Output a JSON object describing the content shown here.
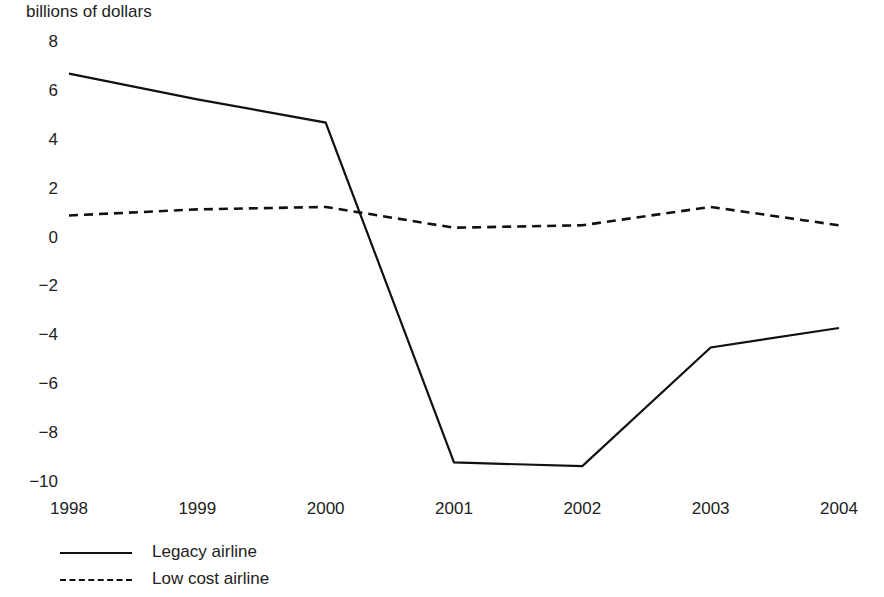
{
  "chart_data": {
    "type": "line",
    "title": "",
    "ylabel": "billions of dollars",
    "xlabel": "",
    "categories": [
      "1998",
      "1999",
      "2000",
      "2001",
      "2002",
      "2003",
      "2004"
    ],
    "x": [
      1998,
      1999,
      2000,
      2001,
      2002,
      2003,
      2004
    ],
    "ylim": [
      -10,
      8
    ],
    "xlim": [
      1998,
      2004
    ],
    "yticks": [
      8,
      6,
      4,
      2,
      0,
      -2,
      -4,
      -6,
      -8,
      -10
    ],
    "ytick_labels": [
      "8",
      "6",
      "4",
      "2",
      "0",
      "−2",
      "−4",
      "−6",
      "−8",
      "−10"
    ],
    "grid": false,
    "legend_position": "below-left",
    "series": [
      {
        "name": "Legacy airline",
        "style": "solid",
        "color": "#111111",
        "values": [
          6.7,
          5.65,
          4.7,
          -9.2,
          -9.35,
          -4.5,
          -3.7
        ]
      },
      {
        "name": "Low cost airline",
        "style": "dashed",
        "color": "#111111",
        "values": [
          0.9,
          1.15,
          1.25,
          0.4,
          0.5,
          1.25,
          0.5
        ]
      }
    ]
  },
  "axis": {
    "ylabel_text": "billions of dollars"
  },
  "legend": {
    "items": [
      {
        "label": "Legacy airline",
        "style": "solid"
      },
      {
        "label": "Low cost airline",
        "style": "dashed"
      }
    ]
  }
}
